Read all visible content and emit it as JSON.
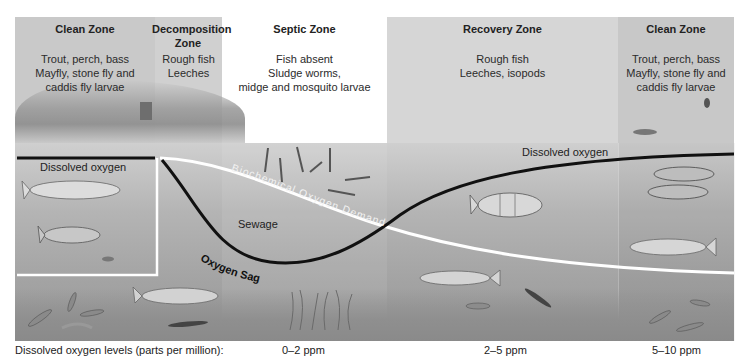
{
  "zones": [
    {
      "title": "Clean Zone",
      "description": [
        "Trout, perch, bass",
        "Mayfly, stone fly and",
        "caddis fly larvae"
      ]
    },
    {
      "title": "Decomposition Zone",
      "description": [
        "Rough fish",
        "Leeches"
      ]
    },
    {
      "title": "Septic Zone",
      "description": [
        "Fish absent",
        "Sludge worms,",
        "midge and mosquito larvae"
      ]
    },
    {
      "title": "Recovery Zone",
      "description": [
        "Rough fish",
        "Leeches, isopods"
      ]
    },
    {
      "title": "Clean Zone",
      "description": [
        "Trout, perch, bass",
        "Mayfly, stone fly and",
        "caddis fly larvae"
      ]
    }
  ],
  "curves": {
    "dissolved_oxygen_left": "Dissolved oxygen",
    "dissolved_oxygen_right": "Dissolved oxygen",
    "bod": "Biochemical Oxygen Demand",
    "sewage": "Sewage",
    "oxygen_sag": "Oxygen Sag"
  },
  "footer": {
    "axis_label": "Dissolved oxygen levels (parts per million):",
    "levels": [
      "0–2 ppm",
      "2–5 ppm",
      "5–10 ppm"
    ]
  },
  "colors": {
    "zone_shaded": "#c9c9c9",
    "zone_light": "#ffffff",
    "oxygen_line": "#111111",
    "bod_line": "#ffffff"
  }
}
